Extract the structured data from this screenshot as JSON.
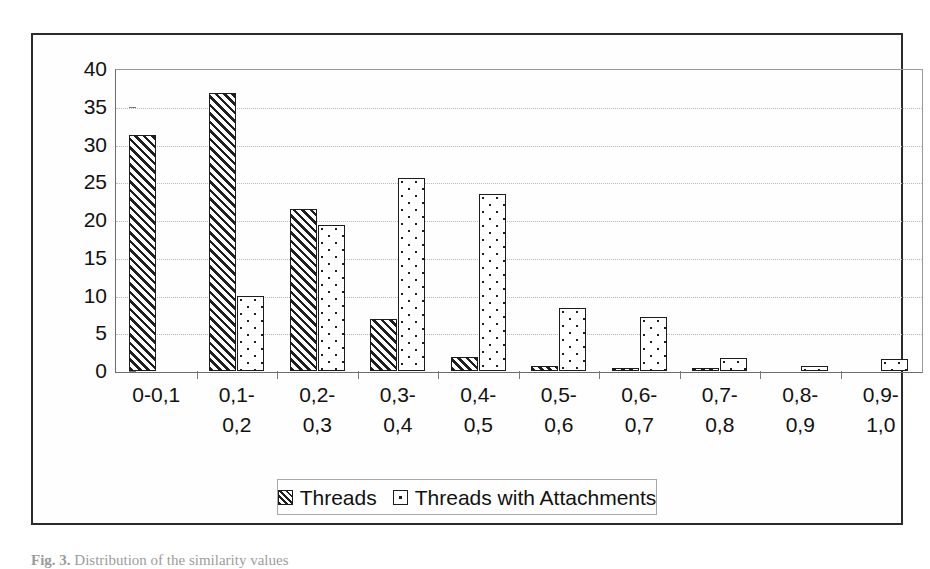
{
  "figure": {
    "caption_prefix": "Fig. 3.",
    "caption_text": "Distribution of the similarity values"
  },
  "legend": {
    "position": "bottom-center",
    "entries": [
      {
        "label": "Threads",
        "pattern": "diagonal-hatch"
      },
      {
        "label": "Threads with Attachments",
        "pattern": "dotted"
      }
    ]
  },
  "chart_data": {
    "type": "bar",
    "title": "",
    "xlabel": "",
    "ylabel": "",
    "ylim": [
      0,
      40
    ],
    "yticks": [
      0,
      5,
      10,
      15,
      20,
      25,
      30,
      35,
      40
    ],
    "ytick_labels": [
      "0",
      "5",
      "10",
      "15",
      "20",
      "25",
      "30",
      "35",
      "40"
    ],
    "grid": true,
    "grid_axis": "y",
    "legend_position": "bottom",
    "categories": [
      "0-0,1",
      "0,1-0,2",
      "0,2-0,3",
      "0,3-0,4",
      "0,4-0,5",
      "0,5-0,6",
      "0,6-0,7",
      "0,7-0,8",
      "0,8-0,9",
      "0,9-1,0"
    ],
    "category_lines": [
      [
        "0-0,1",
        ""
      ],
      [
        "0,1-",
        "0,2"
      ],
      [
        "0,2-",
        "0,3"
      ],
      [
        "0,3-",
        "0,4"
      ],
      [
        "0,4-",
        "0,5"
      ],
      [
        "0,5-",
        "0,6"
      ],
      [
        "0,6-",
        "0,7"
      ],
      [
        "0,7-",
        "0,8"
      ],
      [
        "0,8-",
        "0,9"
      ],
      [
        "0,9-",
        "1,0"
      ]
    ],
    "series": [
      {
        "name": "Threads",
        "pattern": "diagonal-hatch",
        "values": [
          31.2,
          36.8,
          21.4,
          6.9,
          1.9,
          0.6,
          0.2,
          0.15,
          0,
          0
        ]
      },
      {
        "name": "Threads with Attachments",
        "pattern": "dotted",
        "values": [
          0,
          10.0,
          19.4,
          25.6,
          23.5,
          8.3,
          7.2,
          1.7,
          0.6,
          1.6
        ]
      }
    ]
  }
}
